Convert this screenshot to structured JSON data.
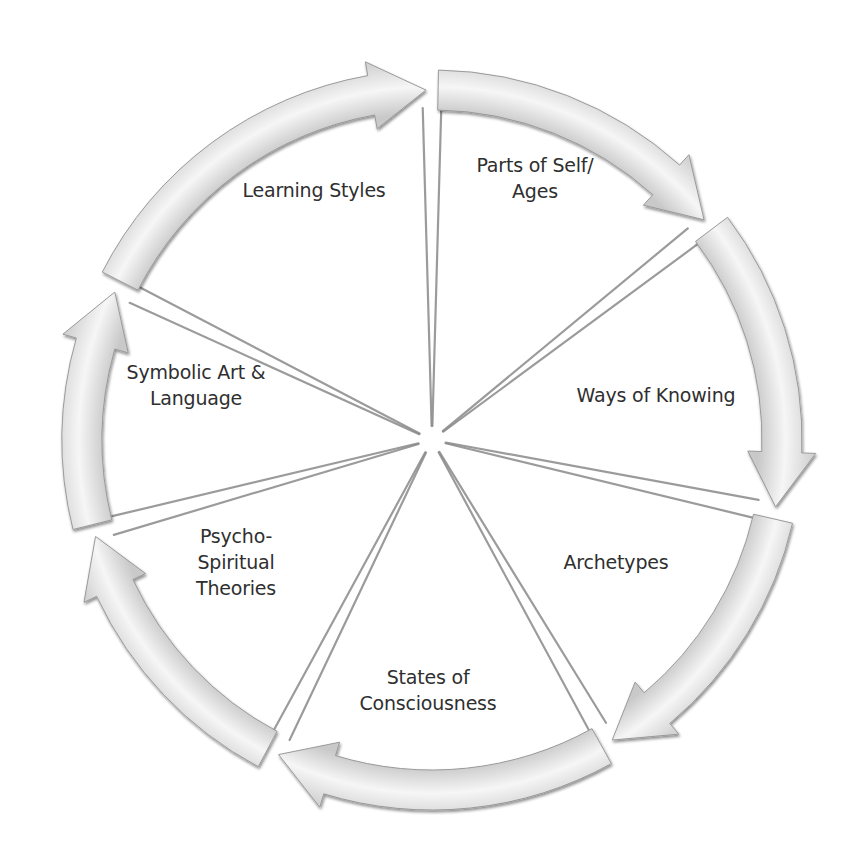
{
  "diagram": {
    "type": "cycle",
    "direction": "clockwise",
    "center": [
      432,
      440
    ],
    "outer_radius": 370,
    "band_width": 40,
    "colors": {
      "background": "#ffffff",
      "arrow_fill_light": "#f7f7f7",
      "arrow_fill_dark": "#cfcfcf",
      "arrow_stroke": "#9a9a9a",
      "divider": "#8a8a8a",
      "text": "#2f2f2f"
    },
    "segments": [
      {
        "id": "learning-styles",
        "label": "Learning Styles",
        "label_pos": [
          314,
          190
        ],
        "start_deg": -63,
        "end_deg": -1
      },
      {
        "id": "parts-of-self",
        "label": "Parts of Self/\nAges",
        "label_pos": [
          535,
          178
        ],
        "start_deg": 1,
        "end_deg": 51
      },
      {
        "id": "ways-of-knowing",
        "label": "Ways of Knowing",
        "label_pos": [
          656,
          395
        ],
        "start_deg": 53,
        "end_deg": 101
      },
      {
        "id": "archetypes",
        "label": "Archetypes",
        "label_pos": [
          616,
          562
        ],
        "start_deg": 103,
        "end_deg": 149
      },
      {
        "id": "states-of-consciousness",
        "label": "States of\nConsciousness",
        "label_pos": [
          428,
          690
        ],
        "start_deg": 151,
        "end_deg": 206
      },
      {
        "id": "psycho-spiritual-theories",
        "label": "Psycho-\nSpiritual\nTheories",
        "label_pos": [
          236,
          562
        ],
        "start_deg": 208,
        "end_deg": 254
      },
      {
        "id": "symbolic-art-language",
        "label": "Symbolic Art &\nLanguage",
        "label_pos": [
          196,
          385
        ],
        "start_deg": 256,
        "end_deg": 295
      }
    ]
  }
}
